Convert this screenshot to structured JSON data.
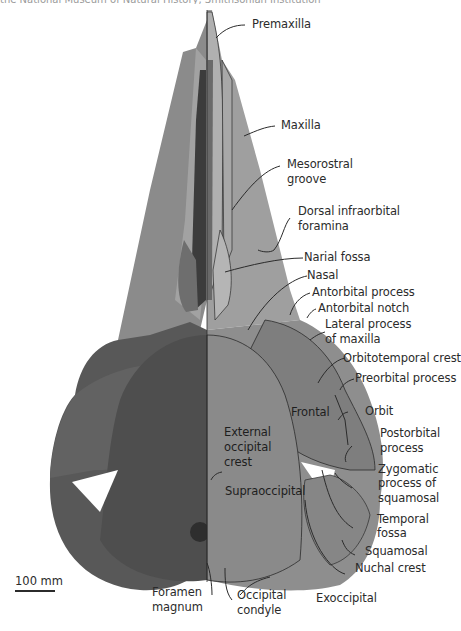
{
  "figure": {
    "top_caption_partial": "the National Museum of Natural History, Smithsonian Institution",
    "colors": {
      "photo_half_dark": "#5a5a5a",
      "photo_rostrum": "#8a8a8a",
      "shaded_half": "#8c8c8c",
      "shaded_rostrum": "#9e9e9e",
      "leader_line": "#2b2b2b",
      "background": "#ffffff"
    }
  },
  "labels": {
    "premaxilla": "Premaxilla",
    "maxilla": "Maxilla",
    "mesorostral_groove_1": "Mesorostral",
    "mesorostral_groove_2": "groove",
    "dorsal_infraorbital_1": "Dorsal infraorbital",
    "dorsal_infraorbital_2": "foramina",
    "narial_fossa": "Narial fossa",
    "nasal": "Nasal",
    "antorbital_process": "Antorbital process",
    "antorbital_notch": "Antorbital notch",
    "lateral_process_1": "Lateral process",
    "lateral_process_2": "of maxilla",
    "orbitotemporal_crest": "Orbitotemporal crest",
    "preorbital_process": "Preorbital process",
    "orbit": "Orbit",
    "postorbital_process_1": "Postorbital",
    "postorbital_process_2": "process",
    "zygomatic_1": "Zygomatic",
    "zygomatic_2": "process of",
    "zygomatic_3": "squamosal",
    "temporal_fossa_1": "Temporal",
    "temporal_fossa_2": "fossa",
    "squamosal": "Squamosal",
    "nuchal_crest": "Nuchal crest",
    "exoccipital": "Exoccipital",
    "occipital_condyle_1": "Occipital",
    "occipital_condyle_2": "condyle",
    "foramen_magnum_1": "Foramen",
    "foramen_magnum_2": "magnum",
    "frontal": "Frontal",
    "external_occipital_1": "External",
    "external_occipital_2": "occipital",
    "external_occipital_3": "crest",
    "supraoccipital": "Supraoccipital"
  },
  "scale_bar": {
    "label": "100 mm",
    "length_px": 40
  }
}
